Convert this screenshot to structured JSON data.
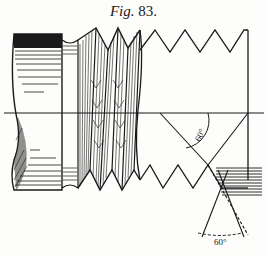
{
  "figure": {
    "caption_prefix": "Fig.",
    "caption_number": "83.",
    "annotations": {
      "upper_angle_label": "60°",
      "lower_angle_label": "60°"
    },
    "parts": [
      "cylindrical-shank",
      "threaded-section",
      "thread-profile-outline",
      "center-axis-line",
      "angle-construction-lines",
      "hatched-thread-section"
    ]
  }
}
